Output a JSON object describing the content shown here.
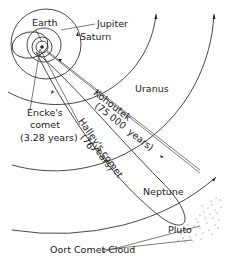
{
  "diagram": {
    "planets": [
      {
        "name": "Earth"
      },
      {
        "name": "Jupiter"
      },
      {
        "name": "Saturn"
      },
      {
        "name": "Uranus"
      },
      {
        "name": "Neptune"
      },
      {
        "name": "Pluto"
      }
    ],
    "comets": {
      "encke": {
        "line1": "Encke's",
        "line2": "comet",
        "line3": "(3.28 years)"
      },
      "kohoutek": {
        "line1": "Kohoutek",
        "line2": "(75 000",
        "line3": "years)"
      },
      "halley": {
        "line1": "Halley's comet",
        "line2": "(76",
        "line3": "years)"
      }
    },
    "oort": {
      "label": "Oort Comet Cloud"
    }
  }
}
